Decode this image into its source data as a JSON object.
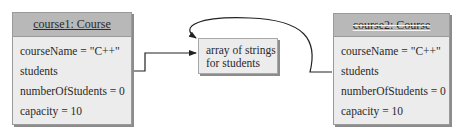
{
  "objects": {
    "course1": {
      "title": "course1: Course",
      "fields": [
        "courseName = \"C++\"",
        "students",
        "numberOfStudents = 0",
        "capacity = 10"
      ]
    },
    "course2": {
      "title": "course2: Course",
      "fields": [
        "courseName = \"C++\"",
        "students",
        "numberOfStudents = 0",
        "capacity = 10"
      ]
    }
  },
  "array_box": {
    "line1": "array of strings",
    "line2": "for students"
  },
  "colors": {
    "header_fill": "#b8b8b8",
    "body_fill": "#ececec",
    "border": "#9a9a9a",
    "line": "#222222"
  }
}
